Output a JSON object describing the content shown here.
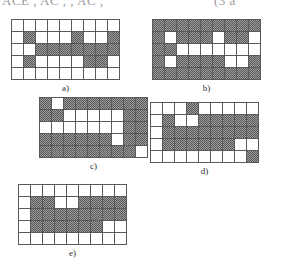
{
  "header": {
    "left_text": "ACE , AC , , AC ,",
    "right_text": "(3 a"
  },
  "figure": {
    "legend_note": "Five binary grid patterns labelled a) through e)",
    "panels": [
      {
        "id": "a",
        "caption": "a)",
        "rows": 5,
        "cols": 9,
        "x": 11,
        "y": 19,
        "grid": [
          [
            0,
            0,
            0,
            0,
            0,
            0,
            0,
            0,
            0
          ],
          [
            0,
            1,
            0,
            0,
            0,
            1,
            0,
            0,
            1
          ],
          [
            0,
            0,
            1,
            1,
            1,
            1,
            1,
            1,
            1
          ],
          [
            0,
            1,
            0,
            0,
            0,
            0,
            1,
            1,
            0
          ],
          [
            0,
            0,
            0,
            0,
            0,
            0,
            0,
            0,
            0
          ]
        ]
      },
      {
        "id": "b",
        "caption": "b)",
        "rows": 5,
        "cols": 9,
        "x": 152,
        "y": 19,
        "grid": [
          [
            1,
            1,
            1,
            1,
            1,
            1,
            1,
            1,
            1
          ],
          [
            1,
            0,
            1,
            1,
            1,
            0,
            1,
            1,
            0
          ],
          [
            1,
            1,
            0,
            0,
            0,
            0,
            0,
            0,
            0
          ],
          [
            1,
            0,
            1,
            1,
            1,
            1,
            0,
            0,
            1
          ],
          [
            1,
            1,
            1,
            1,
            1,
            1,
            1,
            1,
            1
          ]
        ]
      },
      {
        "id": "c",
        "caption": "c)",
        "rows": 5,
        "cols": 9,
        "x": 39,
        "y": 97,
        "grid": [
          [
            1,
            0,
            1,
            1,
            1,
            1,
            1,
            1,
            1
          ],
          [
            1,
            1,
            0,
            0,
            0,
            0,
            0,
            1,
            1
          ],
          [
            0,
            0,
            0,
            0,
            0,
            0,
            0,
            1,
            1
          ],
          [
            1,
            1,
            1,
            1,
            1,
            1,
            0,
            1,
            1
          ],
          [
            1,
            1,
            1,
            1,
            1,
            1,
            1,
            1,
            0
          ]
        ]
      },
      {
        "id": "d",
        "caption": "d)",
        "rows": 5,
        "cols": 9,
        "x": 150,
        "y": 102,
        "grid": [
          [
            0,
            0,
            0,
            1,
            0,
            0,
            0,
            0,
            0
          ],
          [
            0,
            1,
            0,
            0,
            1,
            1,
            1,
            1,
            1
          ],
          [
            0,
            1,
            1,
            1,
            1,
            1,
            1,
            1,
            1
          ],
          [
            0,
            1,
            1,
            1,
            1,
            1,
            1,
            0,
            0
          ],
          [
            0,
            0,
            0,
            0,
            0,
            0,
            0,
            0,
            1
          ]
        ]
      },
      {
        "id": "e",
        "caption": "e)",
        "rows": 5,
        "cols": 9,
        "x": 18,
        "y": 184,
        "grid": [
          [
            0,
            0,
            0,
            0,
            0,
            0,
            0,
            0,
            0
          ],
          [
            0,
            1,
            1,
            0,
            0,
            1,
            1,
            1,
            1
          ],
          [
            0,
            1,
            1,
            1,
            1,
            1,
            1,
            1,
            1
          ],
          [
            0,
            1,
            1,
            1,
            1,
            1,
            1,
            0,
            0
          ],
          [
            0,
            0,
            0,
            0,
            0,
            0,
            0,
            0,
            0
          ]
        ]
      }
    ]
  }
}
